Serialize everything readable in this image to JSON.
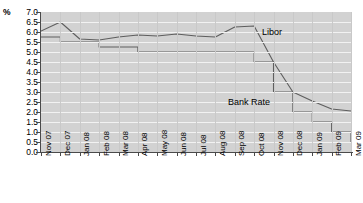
{
  "axis": {
    "unit_label": "%",
    "y_ticks": [
      "7.0",
      "6.5",
      "6.0",
      "5.5",
      "5.0",
      "4.5",
      "4.0",
      "3.5",
      "3.0",
      "2.5",
      "2.0",
      "1.5",
      "1.0",
      "0.5",
      "0.0"
    ],
    "x_ticks": [
      "Nov 07",
      "Dec 07",
      "Jan 08",
      "Feb 08",
      "Mar 08",
      "Apr 08",
      "May 08",
      "Jun 08",
      "Jul 08",
      "Aug 08",
      "Sep 08",
      "Oct 08",
      "Nov 08",
      "Dec 08",
      "Jan 09",
      "Feb 09",
      "Mar 09"
    ]
  },
  "annotations": {
    "libor": "Libor",
    "bank_rate": "Bank Rate"
  },
  "colors": {
    "plot_background": "#d2d2d2",
    "gridline": "#f2f2f2",
    "series": "#5e5e5e",
    "axis": "#4a4a4a"
  },
  "chart_data": {
    "type": "line",
    "title": "",
    "xlabel": "",
    "ylabel": "%",
    "ylim": [
      0.0,
      7.0
    ],
    "ytick_step": 0.5,
    "grid": true,
    "legend": "inline-annotations",
    "x": [
      "Nov 07",
      "Dec 07",
      "Jan 08",
      "Feb 08",
      "Mar 08",
      "Apr 08",
      "May 08",
      "Jun 08",
      "Jul 08",
      "Aug 08",
      "Sep 08",
      "Oct 08",
      "Nov 08",
      "Dec 08",
      "Jan 09",
      "Feb 09",
      "Mar 09"
    ],
    "series": [
      {
        "name": "Libor",
        "values": [
          6.05,
          6.5,
          5.65,
          5.6,
          5.75,
          5.85,
          5.8,
          5.9,
          5.8,
          5.75,
          6.25,
          6.3,
          4.5,
          3.0,
          2.55,
          2.15,
          2.05
        ]
      },
      {
        "name": "Bank Rate",
        "values": [
          5.75,
          5.5,
          5.5,
          5.25,
          5.25,
          5.0,
          5.0,
          5.0,
          5.0,
          5.0,
          5.0,
          4.5,
          3.0,
          2.0,
          1.5,
          1.0,
          0.5
        ]
      }
    ]
  }
}
